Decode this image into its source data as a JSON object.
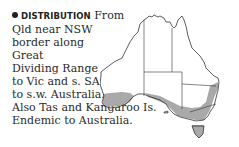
{
  "entry": {
    "heading": "DISTRIBUTION",
    "lines": [
      "From",
      "Qld near NSW",
      "border along",
      "Great",
      "Dividing Range",
      "to Vic and s. SA",
      "to s.w. Australia.",
      "Also Tas and Kangaroo Is.",
      "Endemic to Australia."
    ]
  },
  "map": {
    "region": "Australia",
    "range_fill": "#a9a9a9",
    "outline": "#333333"
  }
}
